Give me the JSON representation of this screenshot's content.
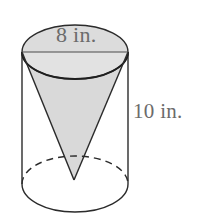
{
  "figure": {
    "name": "cone-inscribed-in-cylinder",
    "type": "geometry-diagram",
    "background_color": "#ffffff",
    "stroke_color": "#2b2b2b",
    "cone_fill_color": "#d9d9d9",
    "cylinder_fill_color": "#ffffff",
    "label_color": "#6b6b6b",
    "labels": {
      "diameter": "8 in.",
      "height": "10 in."
    },
    "measurements": {
      "diameter_value": 8,
      "diameter_unit": "in.",
      "height_value": 10,
      "height_unit": "in."
    },
    "geometry": {
      "cylinder_left_x": 22,
      "cylinder_right_x": 128,
      "top_ellipse_cx": 75,
      "top_ellipse_cy": 52,
      "top_ellipse_rx": 53,
      "top_ellipse_ry": 27,
      "bottom_ellipse_cx": 75,
      "bottom_ellipse_cy": 184,
      "bottom_ellipse_rx": 53,
      "bottom_ellipse_ry": 28,
      "cone_apex_x": 74,
      "cone_apex_y": 180,
      "diameter_line_y": 52
    }
  }
}
